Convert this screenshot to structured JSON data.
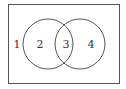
{
  "diagram": {
    "type": "venn",
    "universe": {
      "x": 8,
      "y": 4,
      "width": 112,
      "height": 80
    },
    "circles": [
      {
        "name": "left",
        "cx": 48,
        "cy": 44,
        "r": 25
      },
      {
        "name": "right",
        "cx": 80,
        "cy": 44,
        "r": 25
      }
    ],
    "regions": [
      {
        "label": "1",
        "x": 17,
        "y": 48
      },
      {
        "label": "2",
        "x": 40,
        "y": 48
      },
      {
        "label": "3",
        "x": 66,
        "y": 48
      },
      {
        "label": "4",
        "x": 91,
        "y": 48
      }
    ],
    "stroke_color": "#555555"
  }
}
